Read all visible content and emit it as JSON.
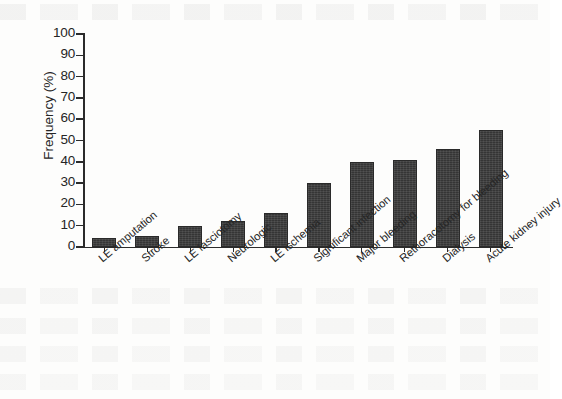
{
  "chart_data": {
    "type": "bar",
    "title": "",
    "xlabel": "",
    "ylabel": "Frequency (%)",
    "ylim": [
      0,
      100
    ],
    "yticks": [
      0,
      10,
      20,
      30,
      40,
      50,
      60,
      70,
      80,
      90,
      100
    ],
    "grid": false,
    "legend": null,
    "bar_color": "#3a3a3a",
    "axis_color": "#2b2b2b",
    "background_color": "#fdfdfc",
    "categories": [
      "LE amputation",
      "Stroke",
      "LE fasciotomy",
      "Neurologic",
      "LE ischemia",
      "Significant infection",
      "Major bleeding",
      "Rethoracotomy for bleeding",
      "Dialysis",
      "Acute kidney injury"
    ],
    "values": [
      4,
      5,
      10,
      12,
      16,
      30,
      40,
      41,
      46,
      55
    ]
  }
}
